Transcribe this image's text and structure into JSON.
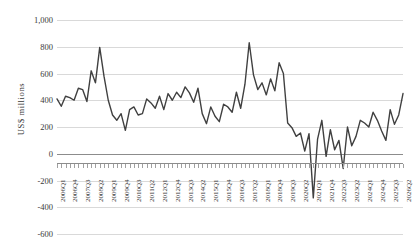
{
  "chart_title": "",
  "axis": {
    "y_title": "US$ millions",
    "y_ticks": [
      "1,000",
      "800",
      "600",
      "400",
      "200",
      "0",
      "-200",
      "-400",
      "-600"
    ],
    "y_tick_values": [
      1000,
      800,
      600,
      400,
      200,
      0,
      -200,
      -400,
      -600
    ]
  },
  "chart_data": {
    "type": "line",
    "title": "",
    "xlabel": "",
    "ylabel": "US$ millions",
    "ylim": [
      -600,
      1000
    ],
    "grid": true,
    "legend": "none",
    "series_color": "#404040",
    "x_tick_step": 3,
    "x_tick_labels": [
      "2006Q1",
      "2006Q4",
      "2007Q3",
      "2008Q2",
      "2009Q1",
      "2009Q4",
      "2010Q3",
      "2011Q2",
      "2012Q1",
      "2012Q4",
      "2013Q3",
      "2014Q2",
      "2015Q1",
      "2015Q4",
      "2016Q3",
      "2017Q2",
      "2018Q1",
      "2018Q4",
      "2019Q3",
      "2020Q2",
      "2021Q1",
      "2021Q4",
      "2022Q3"
    ],
    "x": [
      "2006Q1",
      "2006Q2",
      "2006Q3",
      "2006Q4",
      "2007Q1",
      "2007Q2",
      "2007Q3",
      "2007Q4",
      "2008Q1",
      "2008Q2",
      "2008Q3",
      "2008Q4",
      "2009Q1",
      "2009Q2",
      "2009Q3",
      "2009Q4",
      "2010Q1",
      "2010Q2",
      "2010Q3",
      "2010Q4",
      "2011Q1",
      "2011Q2",
      "2011Q3",
      "2011Q4",
      "2012Q1",
      "2012Q2",
      "2012Q3",
      "2012Q4",
      "2013Q1",
      "2013Q2",
      "2013Q3",
      "2013Q4",
      "2014Q1",
      "2014Q2",
      "2014Q3",
      "2014Q4",
      "2015Q1",
      "2015Q2",
      "2015Q3",
      "2015Q4",
      "2016Q1",
      "2016Q2",
      "2016Q3",
      "2016Q4",
      "2017Q1",
      "2017Q2",
      "2017Q3",
      "2017Q4",
      "2018Q1",
      "2018Q2",
      "2018Q3",
      "2018Q4",
      "2019Q1",
      "2019Q2",
      "2019Q3",
      "2019Q4",
      "2020Q1",
      "2020Q2",
      "2020Q3",
      "2020Q4",
      "2021Q1",
      "2021Q2",
      "2021Q3",
      "2021Q4",
      "2022Q1",
      "2022Q2",
      "2022Q3"
    ],
    "values": [
      410,
      355,
      430,
      420,
      400,
      490,
      480,
      390,
      620,
      530,
      795,
      580,
      400,
      290,
      250,
      300,
      175,
      330,
      350,
      290,
      300,
      410,
      380,
      340,
      430,
      330,
      450,
      400,
      460,
      420,
      500,
      455,
      385,
      490,
      300,
      225,
      350,
      280,
      240,
      370,
      350,
      310,
      460,
      340,
      520,
      830,
      590,
      480,
      530,
      440,
      560,
      470,
      680,
      600,
      230,
      195,
      130,
      155,
      20,
      150,
      -330,
      110,
      250,
      -20,
      180,
      30,
      100
    ],
    "values_tail": [
      -110,
      200,
      60,
      130,
      250,
      230,
      200,
      310,
      250,
      170,
      100,
      330,
      220,
      290,
      450
    ]
  }
}
